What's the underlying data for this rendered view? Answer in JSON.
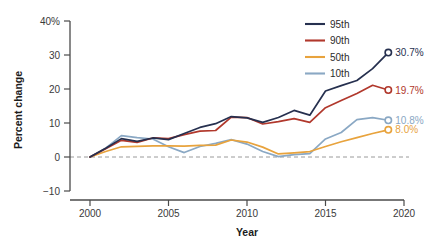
{
  "chart_data": {
    "type": "line",
    "title": "",
    "xlabel": "Year",
    "ylabel": "Percent change",
    "xlim": [
      2000,
      2020
    ],
    "ylim": [
      -10,
      40
    ],
    "xticks": [
      2000,
      2005,
      2010,
      2015,
      2020
    ],
    "xtick_labels": [
      "2000",
      "2005",
      "2010",
      "2015",
      "2020"
    ],
    "yticks": [
      -10,
      0,
      10,
      20,
      30,
      40
    ],
    "ytick_labels": [
      "−10",
      "0",
      "10",
      "20",
      "30",
      "40%"
    ],
    "grid": false,
    "zero_reference_line": true,
    "legend_position": "top-right",
    "x": [
      2000,
      2001,
      2002,
      2003,
      2004,
      2005,
      2006,
      2007,
      2008,
      2009,
      2010,
      2011,
      2012,
      2013,
      2014,
      2015,
      2016,
      2017,
      2018,
      2019
    ],
    "series": [
      {
        "name": "95th",
        "color": "#26304f",
        "end_label": "30.7%",
        "end_value": 30.7,
        "values": [
          0.0,
          2.6,
          5.4,
          4.6,
          5.6,
          5.1,
          6.9,
          8.7,
          9.8,
          11.9,
          11.5,
          10.2,
          11.6,
          13.7,
          12.3,
          19.4,
          21.0,
          22.5,
          26.0,
          30.7
        ]
      },
      {
        "name": "90th",
        "color": "#b1382c",
        "end_label": "19.7%",
        "end_value": 19.7,
        "values": [
          0.0,
          2.4,
          4.9,
          4.3,
          5.6,
          5.4,
          6.6,
          7.6,
          7.8,
          11.7,
          11.6,
          9.7,
          10.4,
          11.3,
          10.2,
          14.5,
          16.6,
          18.7,
          21.1,
          19.7
        ]
      },
      {
        "name": "50th",
        "color": "#e8a33d",
        "end_label": "8.0%",
        "end_value": 8.0,
        "values": [
          0.0,
          1.6,
          3.0,
          3.1,
          3.3,
          3.3,
          3.2,
          3.4,
          3.5,
          5.0,
          4.4,
          2.9,
          0.9,
          1.2,
          1.6,
          3.1,
          4.5,
          5.7,
          6.9,
          8.0
        ]
      },
      {
        "name": "10th",
        "color": "#8aa8c4",
        "end_label": "10.8%",
        "end_value": 10.8,
        "values": [
          0.0,
          2.6,
          6.3,
          5.7,
          5.3,
          3.0,
          1.3,
          3.1,
          4.0,
          5.1,
          3.8,
          1.6,
          0.1,
          0.7,
          1.0,
          5.3,
          7.2,
          11.0,
          11.6,
          10.8
        ]
      }
    ],
    "legend": [
      {
        "label": "95th",
        "color": "#26304f"
      },
      {
        "label": "90th",
        "color": "#b1382c"
      },
      {
        "label": "50th",
        "color": "#e8a33d"
      },
      {
        "label": "10th",
        "color": "#8aa8c4"
      }
    ]
  }
}
